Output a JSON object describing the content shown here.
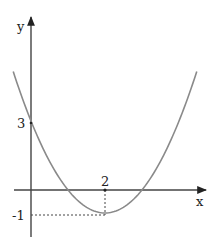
{
  "chart_data": {
    "type": "line",
    "title": "",
    "function": "y = x^2 - 4x + 3",
    "xlabel": "x",
    "ylabel": "y",
    "series": [
      {
        "name": "parabola",
        "x": [
          -0.5,
          0,
          1,
          2,
          3,
          4,
          4.5
        ],
        "y": [
          5.25,
          3,
          0,
          -1,
          0,
          3,
          5.25
        ]
      }
    ],
    "annotations": [
      {
        "label": "3",
        "point": [
          0,
          3
        ],
        "axis": "y"
      },
      {
        "label": "2",
        "point": [
          2,
          0
        ],
        "axis": "x"
      },
      {
        "label": "-1",
        "point": [
          0,
          -1
        ],
        "axis": "y"
      },
      {
        "type": "dashed-guide",
        "from": [
          2,
          0
        ],
        "to": [
          2,
          -1
        ]
      },
      {
        "type": "dashed-guide",
        "from": [
          0,
          -1
        ],
        "to": [
          2,
          -1
        ]
      }
    ],
    "vertex": [
      2,
      -1
    ],
    "grid": false,
    "legend": null
  },
  "labels": {
    "y_axis": "y",
    "x_axis": "x",
    "y_intercept": "3",
    "x_vertex": "2",
    "y_vertex": "-1"
  },
  "colors": {
    "axis": "#333333",
    "curve": "#8a8a8a",
    "guide": "#444444"
  }
}
